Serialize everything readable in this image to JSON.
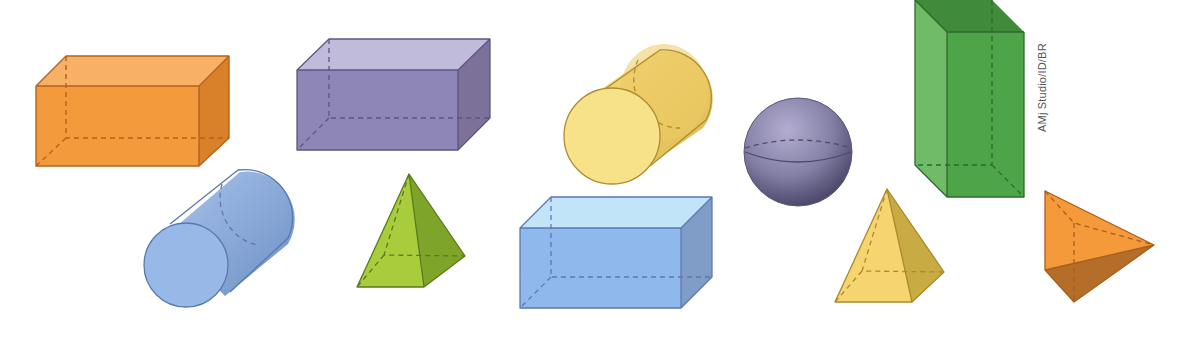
{
  "credit": "AMj Studio/ID/BR",
  "shapes": [
    {
      "id": "orange-box",
      "type": "rectangular prism",
      "color": "#f39a3c"
    },
    {
      "id": "purple-box",
      "type": "rectangular prism",
      "color": "#8f86b8"
    },
    {
      "id": "yellow-cylinder",
      "type": "cylinder",
      "color": "#f3d36e"
    },
    {
      "id": "purple-sphere",
      "type": "sphere",
      "color": "#8581a8"
    },
    {
      "id": "green-tall-box",
      "type": "rectangular prism",
      "color": "#4ea449"
    },
    {
      "id": "blue-cylinder",
      "type": "cylinder",
      "color": "#8fb2e4"
    },
    {
      "id": "green-pyramid",
      "type": "square pyramid",
      "color": "#a8cc3c"
    },
    {
      "id": "blue-box",
      "type": "rectangular prism",
      "color": "#8fb8ec"
    },
    {
      "id": "yellow-pyramid",
      "type": "square pyramid",
      "color": "#f4cd5e"
    },
    {
      "id": "orange-tetrahedron",
      "type": "triangular pyramid",
      "color": "#f59a3a"
    }
  ]
}
